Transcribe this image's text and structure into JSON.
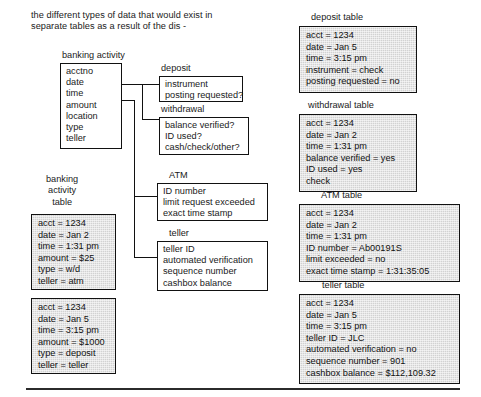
{
  "page": {
    "caption": "the different types of data that would exist in\nseparate tables as a result of the dis -",
    "footer_rule": "horizontal-rule"
  },
  "entities": {
    "banking_activity": {
      "title": "banking activity",
      "fields": [
        "acctno",
        "date",
        "time",
        "amount",
        "location",
        "type",
        "teller"
      ]
    },
    "deposit": {
      "title": "deposit",
      "fields": [
        "instrument",
        "posting requested?"
      ]
    },
    "withdrawal": {
      "title": "withdrawal",
      "fields": [
        "balance verified?",
        "ID used?",
        "cash/check/other?"
      ]
    },
    "atm": {
      "title": "ATM",
      "fields": [
        "ID number",
        "limit request exceeded",
        "exact time stamp"
      ]
    },
    "teller": {
      "title": "teller",
      "fields": [
        "teller ID",
        "automated verification",
        "sequence number",
        "cashbox balance"
      ]
    }
  },
  "tables": {
    "banking_activity_table": {
      "title": "banking\nactivity\ntable",
      "records": [
        {
          "rows": [
            "acct = 1234",
            "date = Jan 2",
            "time = 1:31 pm",
            "amount = $25",
            "type = w/d",
            "teller = atm"
          ]
        },
        {
          "rows": [
            "acct = 1234",
            "date = Jan 5",
            "time = 3:15 pm",
            "amount = $1000",
            "type = deposit",
            "teller = teller"
          ]
        }
      ]
    },
    "deposit_table": {
      "title": "deposit table",
      "rows": [
        "acct = 1234",
        "date = Jan 5",
        "time = 3:15 pm",
        "instrument = check",
        "posting requested = no"
      ]
    },
    "withdrawal_table": {
      "title": "withdrawal table",
      "rows": [
        "acct = 1234",
        "date = Jan 2",
        "time = 1:31 pm",
        "balance verified = yes",
        "ID used = yes",
        "check"
      ]
    },
    "atm_table": {
      "title": "ATM table",
      "rows": [
        "acct = 1234",
        "date = Jan 2",
        "time = 1:31 pm",
        "ID number = Ab00191S",
        "limit exceeded = no",
        "exact time stamp = 1:31:35:05"
      ]
    },
    "teller_table": {
      "title": "teller table",
      "rows": [
        "acct = 1234",
        "date = Jan 5",
        "time = 3:15 pm",
        "teller ID = JLC",
        "automated verification = no",
        "sequence number = 901",
        "cashbox balance = $112,109.32"
      ]
    }
  },
  "colors": {
    "ink": "#111111",
    "table_fill": "#d2d2d2",
    "page": "#ffffff"
  }
}
